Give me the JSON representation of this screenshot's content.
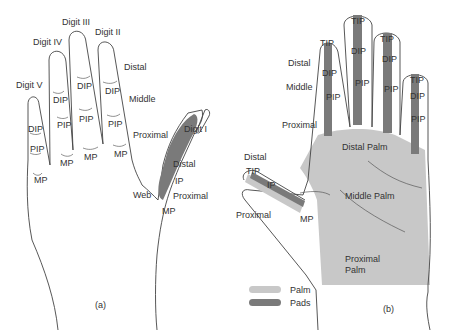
{
  "panel_a": {
    "caption": "(a)",
    "digits": [
      "Digit V",
      "Digit IV",
      "Digit III",
      "Digit II",
      "Digit I"
    ],
    "segments": {
      "distal": "Distal",
      "middle": "Middle",
      "proximal": "Proximal"
    },
    "joints": {
      "dip": "DIP",
      "pip": "PIP",
      "mp": "MP",
      "ip": "IP"
    },
    "thumb_labels": {
      "distal": "Distal",
      "ip": "IP",
      "proximal": "Proximal",
      "web": "Web",
      "mp": "MP"
    }
  },
  "panel_b": {
    "caption": "(b)",
    "segments": {
      "distal": "Distal",
      "middle": "Middle",
      "proximal": "Proximal"
    },
    "joints": {
      "tip": "TIP",
      "dip": "DIP",
      "pip": "PIP",
      "ip": "IP",
      "mp": "MP"
    },
    "palm_regions": {
      "distal": "Distal Palm",
      "middle": "Middle Palm",
      "proximal_1": "Proximal",
      "proximal_2": "Palm"
    },
    "thumb_labels": {
      "distal": "Distal",
      "proximal": "Proximal"
    },
    "legend": [
      {
        "label": "Palm",
        "color": "#c8c8c8"
      },
      {
        "label": "Pads",
        "color": "#7a7a7a"
      }
    ]
  }
}
